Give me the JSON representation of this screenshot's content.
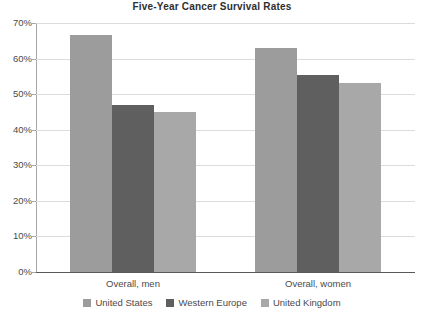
{
  "chart_data": {
    "type": "bar",
    "title": "Five-Year Cancer Survival Rates",
    "xlabel": "",
    "ylabel": "",
    "categories": [
      "Overall, men",
      "Overall, women"
    ],
    "series": [
      {
        "name": "United States",
        "color": "#9c9c9c",
        "values": [
          66.5,
          63.0
        ]
      },
      {
        "name": "Western Europe",
        "color": "#5f5f5f",
        "values": [
          47.0,
          55.5
        ]
      },
      {
        "name": "United Kingdom",
        "color": "#a8a8a8",
        "values": [
          45.0,
          53.0
        ]
      }
    ],
    "ylim": [
      0,
      70
    ],
    "ytick_values": [
      0,
      10,
      20,
      30,
      40,
      50,
      60,
      70
    ],
    "ytick_labels": [
      "0%",
      "10%",
      "20%",
      "30%",
      "40%",
      "50%",
      "60%",
      "70%"
    ],
    "grid": true,
    "legend_position": "bottom",
    "value_suffix": "%"
  },
  "legend": {
    "items": [
      {
        "label": "United States",
        "color": "#9c9c9c"
      },
      {
        "label": "Western Europe",
        "color": "#5f5f5f"
      },
      {
        "label": "United Kingdom",
        "color": "#a8a8a8"
      }
    ]
  }
}
